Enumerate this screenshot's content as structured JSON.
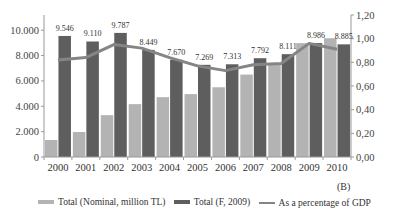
{
  "chart_data": {
    "type": "bar",
    "title": "",
    "panel_label": "(B)",
    "categories": [
      "2000",
      "2001",
      "2002",
      "2003",
      "2004",
      "2005",
      "2006",
      "2007",
      "2008",
      "2009",
      "2010"
    ],
    "series": [
      {
        "name": "Total (Nominal, million TL)",
        "type": "bar",
        "axis": "left",
        "color": "#b3b3b3",
        "values": [
          1340,
          1970,
          3300,
          4170,
          4720,
          4960,
          5500,
          6500,
          7400,
          8980,
          9370
        ]
      },
      {
        "name": "Total (F, 2009)",
        "type": "bar",
        "axis": "left",
        "color": "#5e5e5e",
        "values": [
          9546,
          9110,
          9787,
          8449,
          7670,
          7269,
          7313,
          7792,
          8111,
          8986,
          8885
        ],
        "data_labels": [
          "9.546",
          "9.110",
          "9.787",
          "8.449",
          "7.670",
          "7.269",
          "7.313",
          "7.792",
          "8.111",
          "8.986",
          "8.885"
        ]
      },
      {
        "name": "As a percentage of GDP",
        "type": "line",
        "axis": "right",
        "color": "#858585",
        "values": [
          0.82,
          0.84,
          0.95,
          0.92,
          0.84,
          0.77,
          0.73,
          0.78,
          0.79,
          0.96,
          0.91
        ]
      }
    ],
    "left_axis": {
      "ylim": [
        0,
        11200
      ],
      "ticks": [
        0,
        2000,
        4000,
        6000,
        8000,
        10000
      ],
      "tick_labels": [
        "0",
        "2.000",
        "4.000",
        "6.000",
        "8.000",
        "10.000"
      ]
    },
    "right_axis": {
      "ylim": [
        0,
        1.2
      ],
      "ticks": [
        0,
        0.2,
        0.4,
        0.6,
        0.8,
        1.0,
        1.2
      ],
      "tick_labels": [
        "0,00",
        "0,20",
        "0,40",
        "0,60",
        "0,80",
        "1,00",
        "1,20"
      ]
    },
    "xlabel": "",
    "ylabel": "",
    "grid": false,
    "legend_position": "bottom"
  },
  "legend": [
    {
      "label": "Total (Nominal, million TL)",
      "kind": "bar",
      "color": "#b3b3b3"
    },
    {
      "label": "Total (F, 2009)",
      "kind": "bar",
      "color": "#5e5e5e"
    },
    {
      "label": "As a percentage of GDP",
      "kind": "line",
      "color": "#858585"
    }
  ]
}
